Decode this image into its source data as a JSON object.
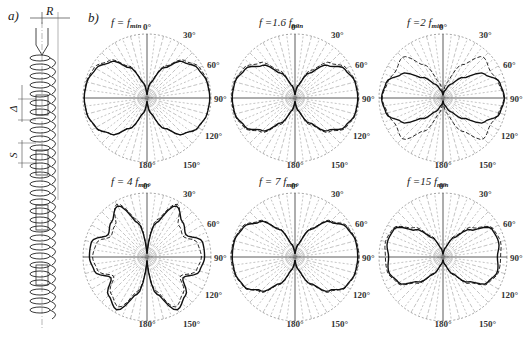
{
  "figure": {
    "panel_a": {
      "letter": "a)",
      "dim_labels": {
        "radius": "R",
        "gap": "Δ",
        "pitch": "S"
      },
      "description": "Side view of a helical spring winding around a cylindrical rod with fins"
    },
    "panel_b": {
      "letter": "b)",
      "plots": [
        {
          "id": "p1",
          "title_prefix": "f = f",
          "title_sub": "min",
          "label": "f = f_min"
        },
        {
          "id": "p2",
          "title_prefix": "f =1.6 f",
          "title_sub": "min",
          "label": "f = 1.6 f_min"
        },
        {
          "id": "p3",
          "title_prefix": "f =2 f",
          "title_sub": "min",
          "label": "f = 2 f_min"
        },
        {
          "id": "p4",
          "title_prefix": "f = 4 f",
          "title_sub": "min",
          "label": "f = 4 f_min"
        },
        {
          "id": "p5",
          "title_prefix": "f = 7 f",
          "title_sub": "min",
          "label": "f = 7 f_min"
        },
        {
          "id": "p6",
          "title_prefix": "f =15 f",
          "title_sub": "min",
          "label": "f = 15 f_min"
        }
      ],
      "angle_labels": [
        "0°",
        "30°",
        "60°",
        "90°",
        "120°",
        "150°",
        "180°"
      ]
    }
  },
  "chart_data": [
    {
      "type": "polar",
      "title": "f = f_min",
      "theta_labels": [
        "0°",
        "30°",
        "60°",
        "90°",
        "120°",
        "150°",
        "180°"
      ],
      "series": [
        {
          "name": "solid",
          "style": "solid",
          "theta": [
            0,
            15,
            30,
            45,
            60,
            75,
            90,
            105,
            120,
            135,
            150,
            165,
            180
          ],
          "r": [
            0.05,
            0.25,
            0.55,
            0.8,
            0.92,
            0.97,
            0.98,
            0.97,
            0.92,
            0.8,
            0.55,
            0.25,
            0.05
          ]
        },
        {
          "name": "dashed",
          "style": "dashed",
          "theta": [
            0,
            15,
            30,
            45,
            60,
            75,
            90,
            105,
            120,
            135,
            150,
            165,
            180
          ],
          "r": [
            0.05,
            0.27,
            0.58,
            0.83,
            0.95,
            0.98,
            0.98,
            0.97,
            0.93,
            0.8,
            0.55,
            0.25,
            0.05
          ]
        }
      ]
    },
    {
      "type": "polar",
      "title": "f = 1.6 f_min",
      "theta_labels": [
        "0°",
        "30°",
        "60°",
        "90°",
        "120°",
        "150°",
        "180°"
      ],
      "series": [
        {
          "name": "solid",
          "style": "solid",
          "theta": [
            0,
            15,
            30,
            45,
            60,
            75,
            90,
            105,
            120,
            135,
            150,
            165,
            180
          ],
          "r": [
            0.05,
            0.2,
            0.45,
            0.72,
            0.9,
            0.97,
            0.98,
            0.97,
            0.9,
            0.72,
            0.45,
            0.2,
            0.05
          ]
        },
        {
          "name": "dashed",
          "style": "dashed",
          "theta": [
            0,
            15,
            30,
            45,
            60,
            75,
            90,
            105,
            120,
            135,
            150,
            165,
            180
          ],
          "r": [
            0.05,
            0.22,
            0.5,
            0.78,
            0.93,
            0.98,
            0.99,
            0.98,
            0.92,
            0.75,
            0.48,
            0.22,
            0.05
          ]
        }
      ]
    },
    {
      "type": "polar",
      "title": "f = 2 f_min",
      "theta_labels": [
        "0°",
        "30°",
        "60°",
        "90°",
        "120°",
        "150°",
        "180°"
      ],
      "series": [
        {
          "name": "solid",
          "style": "solid",
          "theta": [
            0,
            15,
            30,
            45,
            60,
            75,
            90,
            105,
            120,
            135,
            150,
            165,
            180
          ],
          "r": [
            0.05,
            0.12,
            0.25,
            0.45,
            0.75,
            0.92,
            0.96,
            0.92,
            0.75,
            0.45,
            0.25,
            0.12,
            0.05
          ]
        },
        {
          "name": "dashed",
          "style": "dashed",
          "theta": [
            0,
            15,
            30,
            45,
            60,
            75,
            90,
            105,
            120,
            135,
            150,
            165,
            180
          ],
          "r": [
            0.05,
            0.25,
            0.6,
            0.9,
            0.85,
            0.9,
            0.95,
            0.9,
            0.85,
            0.9,
            0.6,
            0.25,
            0.05
          ]
        }
      ]
    },
    {
      "type": "polar",
      "title": "f = 4 f_min",
      "theta_labels": [
        "0°",
        "30°",
        "60°",
        "90°",
        "120°",
        "150°",
        "180°"
      ],
      "series": [
        {
          "name": "solid",
          "style": "solid",
          "theta": [
            0,
            15,
            30,
            45,
            60,
            75,
            90,
            105,
            120,
            135,
            150,
            165,
            180
          ],
          "r": [
            0.05,
            0.55,
            0.92,
            0.78,
            0.7,
            0.9,
            0.9,
            0.85,
            0.65,
            0.85,
            0.95,
            0.6,
            0.05
          ]
        },
        {
          "name": "dashed",
          "style": "dashed",
          "theta": [
            0,
            15,
            30,
            45,
            60,
            75,
            90,
            105,
            120,
            135,
            150,
            165,
            180
          ],
          "r": [
            0.05,
            0.6,
            0.95,
            0.7,
            0.65,
            0.82,
            0.85,
            0.8,
            0.6,
            0.8,
            0.9,
            0.55,
            0.05
          ]
        }
      ]
    },
    {
      "type": "polar",
      "title": "f = 7 f_min",
      "theta_labels": [
        "0°",
        "30°",
        "60°",
        "90°",
        "120°",
        "150°",
        "180°"
      ],
      "series": [
        {
          "name": "solid",
          "style": "solid",
          "theta": [
            0,
            15,
            30,
            45,
            60,
            75,
            90,
            105,
            120,
            135,
            150,
            165,
            180
          ],
          "r": [
            0.05,
            0.2,
            0.5,
            0.78,
            0.93,
            0.98,
            0.98,
            0.97,
            0.92,
            0.75,
            0.48,
            0.2,
            0.05
          ]
        },
        {
          "name": "dashed",
          "style": "dashed",
          "theta": [
            0,
            15,
            30,
            45,
            60,
            75,
            90,
            105,
            120,
            135,
            150,
            165,
            180
          ],
          "r": [
            0.05,
            0.22,
            0.52,
            0.8,
            0.95,
            0.99,
            1.0,
            0.98,
            0.93,
            0.77,
            0.5,
            0.22,
            0.05
          ]
        }
      ]
    },
    {
      "type": "polar",
      "title": "f = 15 f_min",
      "theta_labels": [
        "0°",
        "30°",
        "60°",
        "90°",
        "120°",
        "150°",
        "180°"
      ],
      "series": [
        {
          "name": "solid",
          "style": "solid",
          "theta": [
            0,
            15,
            30,
            45,
            60,
            75,
            90,
            105,
            120,
            135,
            150,
            165,
            180
          ],
          "r": [
            0.05,
            0.15,
            0.35,
            0.6,
            0.88,
            0.9,
            0.85,
            0.88,
            0.8,
            0.55,
            0.3,
            0.12,
            0.05
          ]
        },
        {
          "name": "dashed",
          "style": "dashed",
          "theta": [
            0,
            15,
            30,
            45,
            60,
            75,
            90,
            105,
            120,
            135,
            150,
            165,
            180
          ],
          "r": [
            0.05,
            0.15,
            0.38,
            0.65,
            0.9,
            0.93,
            0.9,
            0.9,
            0.82,
            0.58,
            0.32,
            0.13,
            0.05
          ]
        }
      ]
    }
  ]
}
